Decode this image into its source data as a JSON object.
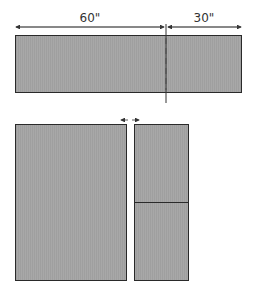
{
  "diagram": {
    "top_piece": {
      "dimensions": [
        {
          "label": "60\"",
          "segment": "left"
        },
        {
          "label": "30\"",
          "segment": "right"
        }
      ],
      "cut_line": "dashed"
    },
    "bottom_pieces": {
      "left_panel": "large",
      "right_panel": "split-two",
      "gap_indicator": "arrows"
    },
    "colors": {
      "fill": "#a6a6a6",
      "stroke": "#2a2a2a",
      "dimension_line": "#333333"
    }
  }
}
